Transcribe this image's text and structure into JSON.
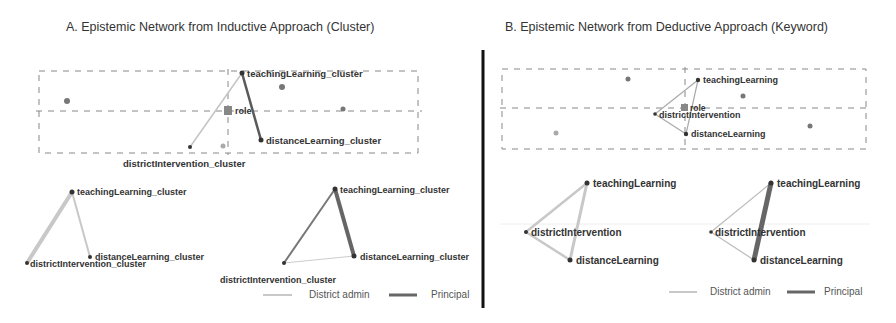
{
  "panels": [
    {
      "title": "A. Epistemic Network from Inductive Approach (Cluster)",
      "top_plot": {
        "nodes": {
          "teaching": "teachingLearning_cluster",
          "distance": "distanceLearning_cluster",
          "district": "districtIntervention_cluster",
          "role": "role"
        }
      },
      "subplots": [
        {
          "group": "District admin",
          "nodes": [
            "teachingLearning_cluster",
            "distanceLearning_cluster",
            "districtIntervention_cluster"
          ]
        },
        {
          "group": "Principal",
          "nodes": [
            "teachingLearning_cluster",
            "distanceLearning_cluster",
            "districtIntervention_cluster"
          ]
        }
      ],
      "legend": {
        "item1": "District admin",
        "item2": "Principal"
      }
    },
    {
      "title": "B. Epistemic Network from Deductive Approach (Keyword)",
      "top_plot": {
        "nodes": {
          "teaching": "teachingLearning",
          "distance": "distanceLearning",
          "district": "districtIntervention",
          "role": "role"
        }
      },
      "subplots": [
        {
          "group": "District admin",
          "nodes": [
            "teachingLearning",
            "districtIntervention",
            "distanceLearning"
          ]
        },
        {
          "group": "Principal",
          "nodes": [
            "teachingLearning",
            "districtIntervention",
            "distanceLearning"
          ]
        }
      ],
      "legend": {
        "item1": "District admin",
        "item2": "Principal"
      }
    }
  ],
  "colors": {
    "district_admin": "#c4c4c4",
    "principal": "#6a6a6a",
    "divider": "#111111"
  }
}
